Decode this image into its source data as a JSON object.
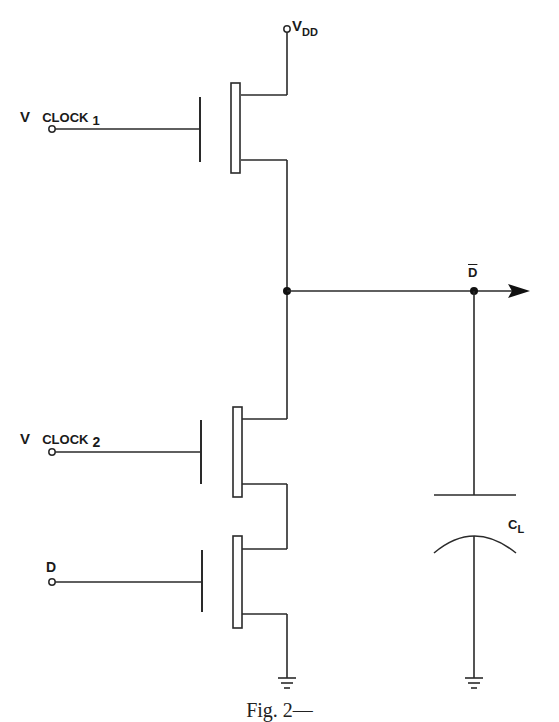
{
  "diagram": {
    "type": "circuit-schematic",
    "labels": {
      "vdd": {
        "main": "V",
        "sub": "DD"
      },
      "clock1": {
        "main": "V",
        "name": "CLOCK",
        "index": "1"
      },
      "clock2": {
        "main": "V",
        "name": "CLOCK",
        "index": "2"
      },
      "d_input": "D",
      "d_bar_output": "D",
      "load_cap": {
        "main": "C",
        "sub": "L"
      }
    },
    "components": [
      {
        "id": "T1",
        "kind": "mos-transistor",
        "gate": "V CLOCK 1",
        "drain": "VDD",
        "source": "output node"
      },
      {
        "id": "T2",
        "kind": "mos-transistor",
        "gate": "V CLOCK 2",
        "drain": "output node",
        "source": "T3 drain"
      },
      {
        "id": "T3",
        "kind": "mos-transistor",
        "gate": "D",
        "drain": "T2 source",
        "source": "ground"
      },
      {
        "id": "CL",
        "kind": "capacitor",
        "between": [
          "output node",
          "ground"
        ]
      }
    ],
    "nodes": [
      {
        "id": "output",
        "label": "D-bar",
        "junction": true
      },
      {
        "id": "vdd",
        "label": "VDD",
        "terminal": true
      },
      {
        "id": "gnd1",
        "kind": "ground"
      },
      {
        "id": "gnd2",
        "kind": "ground"
      }
    ],
    "caption": "Fig. 2—"
  }
}
